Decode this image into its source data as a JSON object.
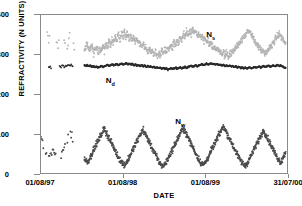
{
  "chart_data": {
    "type": "scatter",
    "title": "",
    "xlabel": "DATE",
    "ylabel": "REFRACTIVITY (N UNITS)",
    "ylim": [
      0,
      400
    ],
    "yticks": [
      0,
      100,
      200,
      300,
      400
    ],
    "xticks": [
      "01/08/97",
      "01/08/98",
      "01/08/99",
      "31/07/00"
    ],
    "xtick_positions": [
      0,
      0.3333,
      0.6667,
      1.0
    ],
    "grid": false,
    "legend": "inline-annotations",
    "annotations": [
      {
        "name": "Ns",
        "base": "N",
        "sub": "s",
        "x": 0.67,
        "y": 348
      },
      {
        "name": "Nd",
        "base": "N",
        "sub": "d",
        "x": 0.265,
        "y": 232
      },
      {
        "name": "Nw",
        "base": "N",
        "sub": "w",
        "x": 0.545,
        "y": 131
      }
    ],
    "series": [
      {
        "name": "Ns",
        "label": "N_s",
        "color": "#b4b4b4",
        "marker": "dot",
        "description": "Total surface refractivity, seasonal cycle ~300-365",
        "baseline": 328,
        "amplitude": 22,
        "noise": 16,
        "range": [
          288,
          372
        ],
        "data_start": 0.02,
        "sparse_until": 0.16
      },
      {
        "name": "Nd",
        "label": "N_d",
        "color": "#2b2b2b",
        "marker": "dot",
        "description": "Dry refractivity, narrow band ~262-278",
        "baseline": 269,
        "amplitude": 5,
        "noise": 3.5,
        "range": [
          258,
          282
        ],
        "data_start": 0.02,
        "sparse_until": 0.16
      },
      {
        "name": "Nw",
        "label": "N_w",
        "color": "#4a4a4a",
        "marker": "dot",
        "description": "Wet refractivity, strong seasonal cycle ~20-110",
        "baseline": 62,
        "amplitude": 34,
        "noise": 15,
        "range": [
          8,
          130
        ],
        "data_start": 0.0,
        "sparse_until": 0.16
      }
    ],
    "ns_values": [
      352,
      338,
      345,
      330,
      360,
      322,
      344,
      334,
      318,
      350,
      336,
      328,
      342,
      355,
      330,
      320,
      340,
      316,
      348,
      334,
      326,
      318,
      330,
      310,
      322,
      336,
      314,
      328,
      308,
      318,
      330,
      312,
      316,
      326,
      300,
      312,
      322,
      304,
      318,
      308,
      324,
      312,
      330,
      318,
      336,
      322,
      340,
      328,
      346,
      334,
      352,
      338,
      356,
      344,
      360,
      346,
      352,
      340,
      348,
      336,
      344,
      330,
      338,
      326,
      332,
      320,
      326,
      314,
      320,
      308,
      316,
      304,
      310,
      300,
      306,
      296,
      304,
      300,
      310,
      304,
      314,
      308,
      320,
      312,
      326,
      318,
      332,
      324,
      338,
      330,
      344,
      336,
      350,
      342,
      356,
      348,
      360,
      352,
      364,
      356,
      358,
      348,
      352,
      342,
      346,
      336,
      340,
      330,
      334,
      324,
      328,
      318,
      322,
      312,
      316,
      306,
      310,
      302,
      306,
      298,
      302,
      296,
      300,
      304,
      308,
      312,
      318,
      322,
      328,
      334,
      340,
      346,
      352,
      356,
      360,
      354,
      348,
      342,
      336,
      330,
      324,
      318,
      312,
      308,
      304,
      300,
      306,
      312,
      318,
      324,
      330,
      336,
      342,
      348,
      352,
      346,
      340,
      334,
      328,
      322
    ],
    "nd_values": [
      266,
      268,
      267,
      269,
      266,
      270,
      268,
      267,
      269,
      271,
      268,
      270,
      272,
      269,
      271,
      268,
      270,
      272,
      274,
      271,
      273,
      270,
      272,
      274,
      276,
      273,
      275,
      272,
      274,
      271,
      273,
      270,
      272,
      269,
      271,
      268,
      270,
      267,
      269,
      271,
      268,
      270,
      272,
      274,
      271,
      273,
      275,
      272,
      274,
      276,
      273,
      275,
      277,
      274,
      276,
      278,
      275,
      277,
      274,
      276,
      273,
      275,
      272,
      274,
      271,
      273,
      270,
      272,
      269,
      271,
      268,
      270,
      267,
      269,
      266,
      268,
      265,
      267,
      264,
      266,
      263,
      265,
      262,
      264,
      266,
      263,
      265,
      267,
      264,
      266,
      268,
      265,
      267,
      269,
      266,
      268,
      270,
      272,
      269,
      271,
      273,
      270,
      272,
      274,
      276,
      273,
      275,
      277,
      274,
      276,
      278,
      275,
      277,
      274,
      276,
      273,
      275,
      272,
      274,
      271,
      273,
      270,
      272,
      269,
      271,
      268,
      270,
      267,
      269,
      266,
      268,
      265,
      267,
      264,
      266,
      268,
      265,
      267,
      269,
      266,
      268,
      270,
      267,
      269,
      271,
      268,
      270,
      272,
      269,
      271,
      273,
      270,
      272,
      274,
      271,
      273,
      270,
      268,
      266,
      268
    ],
    "nw_values": [
      88,
      72,
      64,
      56,
      44,
      38,
      42,
      50,
      58,
      48,
      40,
      36,
      44,
      52,
      60,
      68,
      76,
      84,
      92,
      100,
      96,
      88,
      80,
      72,
      64,
      56,
      48,
      40,
      36,
      32,
      28,
      34,
      42,
      50,
      58,
      66,
      74,
      82,
      90,
      98,
      106,
      112,
      104,
      96,
      88,
      80,
      72,
      64,
      56,
      48,
      40,
      34,
      28,
      24,
      20,
      26,
      32,
      40,
      48,
      56,
      64,
      72,
      80,
      88,
      96,
      104,
      110,
      102,
      94,
      86,
      78,
      70,
      62,
      54,
      46,
      38,
      30,
      24,
      20,
      18,
      22,
      28,
      36,
      44,
      52,
      60,
      68,
      76,
      84,
      92,
      100,
      108,
      114,
      106,
      98,
      90,
      82,
      74,
      66,
      58,
      50,
      42,
      34,
      28,
      24,
      20,
      26,
      32,
      40,
      48,
      56,
      64,
      72,
      80,
      88,
      96,
      104,
      112,
      118,
      110,
      102,
      94,
      86,
      78,
      70,
      62,
      54,
      46,
      38,
      32,
      26,
      22,
      18,
      24,
      30,
      38,
      46,
      54,
      62,
      70,
      78,
      86,
      94,
      102,
      108,
      100,
      92,
      84,
      76,
      68,
      60,
      52,
      44,
      38,
      32,
      28,
      36,
      44,
      52,
      60
    ]
  }
}
